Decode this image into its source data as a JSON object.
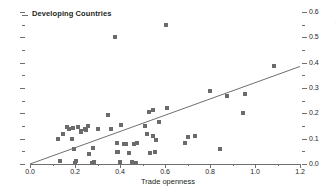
{
  "chart_data": {
    "type": "scatter",
    "title": "Developing Countries",
    "xlabel": "Trade openness",
    "ylabel": "Financial openness",
    "xlim": [
      0.0,
      1.2
    ],
    "ylim": [
      0.0,
      0.6
    ],
    "x_ticks": [
      "0.0",
      "0.2",
      "0.4",
      "0.6",
      "0.8",
      "1.0",
      "1.2"
    ],
    "x_tick_values": [
      0.0,
      0.2,
      0.4,
      0.6,
      0.8,
      1.0,
      1.2
    ],
    "x_minor_values": [
      0.1,
      0.3,
      0.5,
      0.7,
      0.9,
      1.1
    ],
    "y_ticks": [
      "0.0",
      "0.1",
      "0.2",
      "0.3",
      "0.4",
      "0.5",
      "0.6"
    ],
    "y_tick_values": [
      0.0,
      0.1,
      0.2,
      0.3,
      0.4,
      0.5,
      0.6
    ],
    "y_minor_values": [
      0.05,
      0.15,
      0.25,
      0.35,
      0.45,
      0.55
    ],
    "y_axis_position": "right",
    "grid": false,
    "legend": false,
    "marker": "square",
    "marker_color": "#6b6b6b",
    "line_color": "#6f6f6f",
    "axis_color": "#6f6f6f",
    "points": [
      [
        0.125,
        0.098
      ],
      [
        0.135,
        0.012
      ],
      [
        0.145,
        0.118
      ],
      [
        0.165,
        0.148
      ],
      [
        0.175,
        0.138
      ],
      [
        0.185,
        0.1
      ],
      [
        0.19,
        0.143
      ],
      [
        0.195,
        0.06
      ],
      [
        0.198,
        0.004
      ],
      [
        0.205,
        0.011
      ],
      [
        0.215,
        0.145
      ],
      [
        0.225,
        0.128
      ],
      [
        0.228,
        0.132
      ],
      [
        0.245,
        0.14
      ],
      [
        0.248,
        0.135
      ],
      [
        0.258,
        0.15
      ],
      [
        0.262,
        0.04
      ],
      [
        0.275,
        0.005
      ],
      [
        0.28,
        0.062
      ],
      [
        0.285,
        0.006
      ],
      [
        0.3,
        0.14
      ],
      [
        0.345,
        0.195
      ],
      [
        0.358,
        0.14
      ],
      [
        0.378,
        0.5
      ],
      [
        0.385,
        0.082
      ],
      [
        0.388,
        0.046
      ],
      [
        0.392,
        0.048
      ],
      [
        0.398,
        0.006
      ],
      [
        0.405,
        0.155
      ],
      [
        0.418,
        0.078
      ],
      [
        0.428,
        0.08
      ],
      [
        0.44,
        0.042
      ],
      [
        0.452,
        0.008
      ],
      [
        0.462,
        0.08
      ],
      [
        0.472,
        0.004
      ],
      [
        0.475,
        0.082
      ],
      [
        0.51,
        0.15
      ],
      [
        0.52,
        0.12
      ],
      [
        0.528,
        0.205
      ],
      [
        0.535,
        0.045
      ],
      [
        0.545,
        0.112
      ],
      [
        0.548,
        0.215
      ],
      [
        0.555,
        0.046
      ],
      [
        0.56,
        0.095
      ],
      [
        0.575,
        0.165
      ],
      [
        0.605,
        0.55
      ],
      [
        0.607,
        0.222
      ],
      [
        0.69,
        0.082
      ],
      [
        0.7,
        0.105
      ],
      [
        0.735,
        0.112
      ],
      [
        0.8,
        0.29
      ],
      [
        0.845,
        0.058
      ],
      [
        0.875,
        0.268
      ],
      [
        0.945,
        0.2
      ],
      [
        0.955,
        0.275
      ],
      [
        1.085,
        0.385
      ]
    ],
    "trend_line": {
      "x_start": 0.0,
      "y_start": 0.0,
      "x_end": 1.2,
      "y_end": 0.385
    }
  }
}
